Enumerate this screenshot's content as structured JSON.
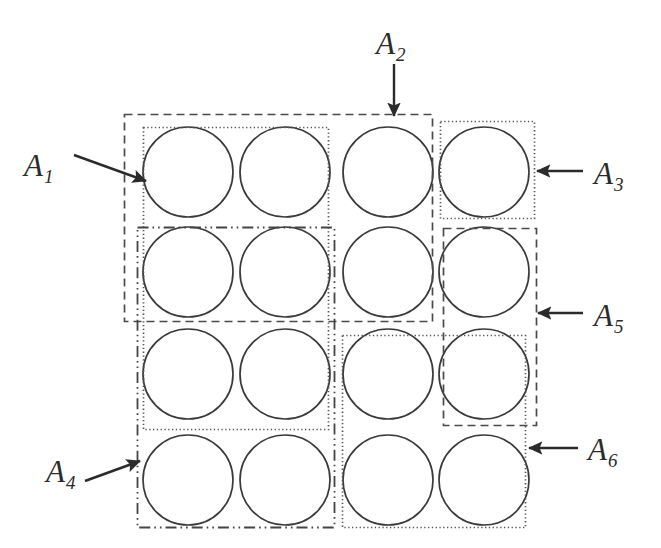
{
  "figure": {
    "canvas": {
      "width": 661,
      "height": 548,
      "background": "#ffffff"
    },
    "stroke_color": "#3a3a3a",
    "circle_color": "#3a3a3a"
  },
  "grid": {
    "rows": 4,
    "cols": 4,
    "circle_radius": 45,
    "column_centers": [
      188,
      285,
      388,
      484
    ],
    "row_centers": [
      172,
      272,
      374,
      480
    ],
    "circle_count": 16
  },
  "regions": [
    {
      "id": "A1",
      "label": "A",
      "subscript": "1",
      "line_style": "dotted",
      "x": 143,
      "y": 127,
      "width": 185,
      "height": 302,
      "covers": "columns 1-2, rows 1-3",
      "color": "#555555"
    },
    {
      "id": "A2",
      "label": "A",
      "subscript": "2",
      "line_style": "dashed",
      "x": 124,
      "y": 114,
      "width": 308,
      "height": 207,
      "covers": "columns 1-3, rows 1-2",
      "color": "#4a4a4a"
    },
    {
      "id": "A3",
      "label": "A",
      "subscript": "3",
      "line_style": "dotted",
      "x": 440,
      "y": 121,
      "width": 94,
      "height": 97,
      "covers": "column 4, row 1",
      "color": "#555555"
    },
    {
      "id": "A4",
      "label": "A",
      "subscript": "4",
      "line_style": "dash-dot-dot",
      "x": 137,
      "y": 227,
      "width": 197,
      "height": 300,
      "covers": "columns 1-2, rows 2-4",
      "color": "#444444"
    },
    {
      "id": "A5",
      "label": "A",
      "subscript": "5",
      "line_style": "dashed",
      "x": 443,
      "y": 228,
      "width": 93,
      "height": 197,
      "covers": "column 4, rows 2-3",
      "color": "#4a4a4a"
    },
    {
      "id": "A6",
      "label": "A",
      "subscript": "6",
      "line_style": "dotted",
      "x": 342,
      "y": 335,
      "width": 183,
      "height": 192,
      "covers": "columns 3-4, rows 3-4",
      "color": "#555555"
    }
  ],
  "labels": [
    {
      "id": "A1",
      "base": "A",
      "sub": "1",
      "left": 24,
      "top": 150
    },
    {
      "id": "A2",
      "base": "A",
      "sub": "2",
      "left": 376,
      "top": 28
    },
    {
      "id": "A3",
      "base": "A",
      "sub": "3",
      "left": 594,
      "top": 158
    },
    {
      "id": "A4",
      "base": "A",
      "sub": "4",
      "left": 46,
      "top": 456
    },
    {
      "id": "A5",
      "base": "A",
      "sub": "5",
      "left": 594,
      "top": 300
    },
    {
      "id": "A6",
      "base": "A",
      "sub": "6",
      "left": 588,
      "top": 434
    }
  ],
  "arrows": [
    {
      "id": "arrow-A1",
      "from_x": 74,
      "from_y": 155,
      "to_x": 146,
      "to_y": 181,
      "points_to": "A1"
    },
    {
      "id": "arrow-A2",
      "from_x": 394,
      "from_y": 64,
      "to_x": 394,
      "to_y": 116,
      "points_to": "A2"
    },
    {
      "id": "arrow-A3",
      "from_x": 583,
      "from_y": 171,
      "to_x": 537,
      "to_y": 171,
      "points_to": "A3"
    },
    {
      "id": "arrow-A4",
      "from_x": 85,
      "from_y": 481,
      "to_x": 140,
      "to_y": 461,
      "points_to": "A4"
    },
    {
      "id": "arrow-A5",
      "from_x": 583,
      "from_y": 313,
      "to_x": 538,
      "to_y": 313,
      "points_to": "A5"
    },
    {
      "id": "arrow-A6",
      "from_x": 578,
      "from_y": 448,
      "to_x": 529,
      "to_y": 448,
      "points_to": "A6"
    }
  ]
}
